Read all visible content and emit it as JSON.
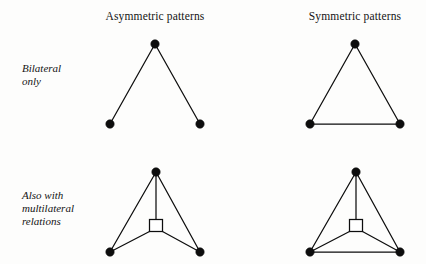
{
  "figure": {
    "background_color": "#fdfdfc",
    "ink_color": "#0d0d0d",
    "column_headers": [
      {
        "id": "asymmetric",
        "label": "Asymmetric patterns"
      },
      {
        "id": "symmetric",
        "label": "Symmetric patterns"
      }
    ],
    "row_labels": [
      {
        "id": "bilateral",
        "label": "Bilateral\nonly"
      },
      {
        "id": "multilateral",
        "label": "Also with\nmultilateral\nrelations"
      }
    ],
    "diagrams": [
      {
        "id": "asymmetric-bilateral",
        "row": "bilateral",
        "column": "asymmetric",
        "description": "open V: apex joined to two base nodes, no base edge",
        "round_nodes": [
          {
            "name": "apex",
            "cx": 155,
            "cy": 44,
            "r": 4.2
          },
          {
            "name": "base-left",
            "cx": 110,
            "cy": 124,
            "r": 4.2
          },
          {
            "name": "base-right",
            "cx": 200,
            "cy": 124,
            "r": 4.2
          }
        ],
        "square_nodes": [],
        "edges": [
          {
            "name": "apex-to-base-left",
            "x1": 155,
            "y1": 44,
            "x2": 110,
            "y2": 124
          },
          {
            "name": "apex-to-base-right",
            "x1": 155,
            "y1": 44,
            "x2": 200,
            "y2": 124
          }
        ]
      },
      {
        "id": "symmetric-bilateral",
        "row": "bilateral",
        "column": "symmetric",
        "description": "closed triangle: apex joined to two base nodes plus base edge",
        "round_nodes": [
          {
            "name": "apex",
            "cx": 355,
            "cy": 44,
            "r": 4.2
          },
          {
            "name": "base-left",
            "cx": 310,
            "cy": 124,
            "r": 4.2
          },
          {
            "name": "base-right",
            "cx": 400,
            "cy": 124,
            "r": 4.2
          }
        ],
        "square_nodes": [],
        "edges": [
          {
            "name": "apex-to-base-left",
            "x1": 355,
            "y1": 44,
            "x2": 310,
            "y2": 124
          },
          {
            "name": "apex-to-base-right",
            "x1": 355,
            "y1": 44,
            "x2": 400,
            "y2": 124
          },
          {
            "name": "base-left-to-base-right",
            "x1": 310,
            "y1": 124,
            "x2": 400,
            "y2": 124
          }
        ]
      },
      {
        "id": "asymmetric-multilateral",
        "row": "multilateral",
        "column": "asymmetric",
        "description": "apex joined to two base nodes and to a central square; square joined to both base nodes; no base edge",
        "round_nodes": [
          {
            "name": "apex",
            "cx": 156,
            "cy": 172,
            "r": 4.2
          },
          {
            "name": "base-left",
            "cx": 110,
            "cy": 252,
            "r": 4.2
          },
          {
            "name": "base-right",
            "cx": 200,
            "cy": 252,
            "r": 4.2
          }
        ],
        "square_nodes": [
          {
            "name": "multilateral-relation-square",
            "x": 149.5,
            "y": 219.5,
            "w": 13,
            "h": 12
          }
        ],
        "edges": [
          {
            "name": "apex-to-base-left",
            "x1": 156,
            "y1": 172,
            "x2": 110,
            "y2": 252
          },
          {
            "name": "apex-to-base-right",
            "x1": 156,
            "y1": 172,
            "x2": 200,
            "y2": 252
          },
          {
            "name": "apex-to-square",
            "x1": 156,
            "y1": 172,
            "x2": 156,
            "y2": 219.5
          },
          {
            "name": "square-to-base-left",
            "x1": 149.5,
            "y1": 231.5,
            "x2": 110,
            "y2": 252
          },
          {
            "name": "square-to-base-right",
            "x1": 162.5,
            "y1": 231.5,
            "x2": 200,
            "y2": 252
          }
        ]
      },
      {
        "id": "symmetric-multilateral",
        "row": "multilateral",
        "column": "symmetric",
        "description": "apex joined to two base nodes and to a central square; square joined to both base nodes; base edge present",
        "round_nodes": [
          {
            "name": "apex",
            "cx": 356,
            "cy": 172,
            "r": 4.2
          },
          {
            "name": "base-left",
            "cx": 310,
            "cy": 252,
            "r": 4.2
          },
          {
            "name": "base-right",
            "cx": 400,
            "cy": 252,
            "r": 4.2
          }
        ],
        "square_nodes": [
          {
            "name": "multilateral-relation-square",
            "x": 349.5,
            "y": 219.5,
            "w": 13,
            "h": 12
          }
        ],
        "edges": [
          {
            "name": "apex-to-base-left",
            "x1": 356,
            "y1": 172,
            "x2": 310,
            "y2": 252
          },
          {
            "name": "apex-to-base-right",
            "x1": 356,
            "y1": 172,
            "x2": 400,
            "y2": 252
          },
          {
            "name": "apex-to-square",
            "x1": 356,
            "y1": 172,
            "x2": 356,
            "y2": 219.5
          },
          {
            "name": "square-to-base-left",
            "x1": 349.5,
            "y1": 231.5,
            "x2": 310,
            "y2": 252
          },
          {
            "name": "square-to-base-right",
            "x1": 362.5,
            "y1": 231.5,
            "x2": 400,
            "y2": 252
          },
          {
            "name": "base-left-to-base-right",
            "x1": 310,
            "y1": 252,
            "x2": 400,
            "y2": 252
          }
        ]
      }
    ]
  }
}
